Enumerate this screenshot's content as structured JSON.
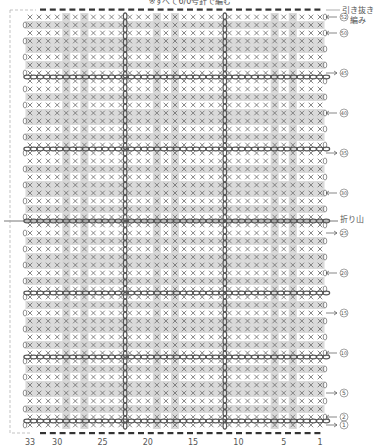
{
  "header_note": "※すべて6/0号針で編む",
  "top_right_note": [
    "引き抜き",
    "編み"
  ],
  "fold_label": "折り山",
  "grid": {
    "columns": 33,
    "rows": 52,
    "stitch_symbol": "×",
    "gray_columns": [
      29,
      27,
      19,
      17,
      6,
      4
    ],
    "gray_rows": [
      3,
      5,
      6,
      8,
      11,
      13,
      14,
      16,
      19,
      21,
      22,
      24,
      28,
      30,
      31,
      33,
      37,
      39,
      40,
      42,
      46,
      48,
      49,
      51
    ],
    "chain_rows": [
      2,
      10,
      18,
      27,
      36,
      45
    ],
    "chain_columns": [
      23,
      12
    ],
    "fold_row": 27
  },
  "row_labels": [
    {
      "row": 52,
      "text": "52",
      "arrow": "left"
    },
    {
      "row": 50,
      "text": "50",
      "arrow": "left"
    },
    {
      "row": 45,
      "text": "45",
      "arrow": "right"
    },
    {
      "row": 40,
      "text": "40",
      "arrow": "left"
    },
    {
      "row": 35,
      "text": "35",
      "arrow": "right"
    },
    {
      "row": 30,
      "text": "30",
      "arrow": "left"
    },
    {
      "row": 25,
      "text": "25",
      "arrow": "right"
    },
    {
      "row": 20,
      "text": "20",
      "arrow": "left"
    },
    {
      "row": 15,
      "text": "15",
      "arrow": "right"
    },
    {
      "row": 10,
      "text": "10",
      "arrow": "left"
    },
    {
      "row": 5,
      "text": "5",
      "arrow": "right"
    },
    {
      "row": 2,
      "text": "2",
      "arrow": "left"
    },
    {
      "row": 1,
      "text": "1",
      "arrow": "right"
    }
  ],
  "column_labels": [
    {
      "col": 33,
      "text": "33"
    },
    {
      "col": 30,
      "text": "30"
    },
    {
      "col": 25,
      "text": "25"
    },
    {
      "col": 20,
      "text": "20"
    },
    {
      "col": 15,
      "text": "15"
    },
    {
      "col": 10,
      "text": "10"
    },
    {
      "col": 5,
      "text": "5"
    },
    {
      "col": 1,
      "text": "1"
    }
  ],
  "colors": {
    "gray_band": "#d4d4d4",
    "stitch": "#777777",
    "chain": "#555555",
    "dash": "#333333",
    "outline": "#aaaaaa"
  }
}
